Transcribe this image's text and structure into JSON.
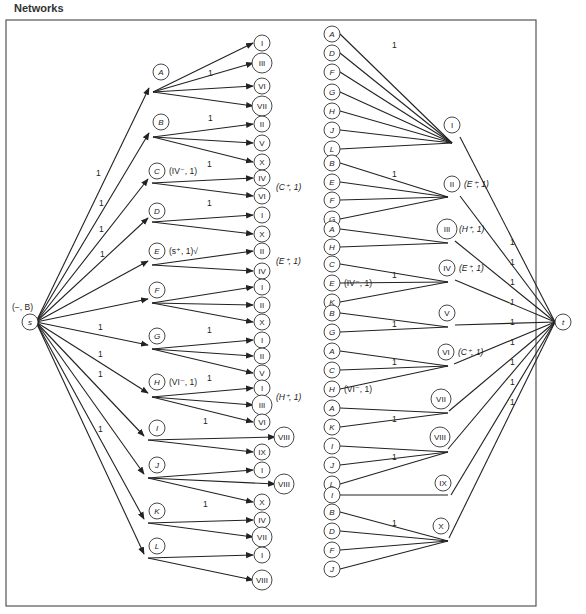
{
  "title": "Networks",
  "source": {
    "id": "s",
    "label": "s",
    "tag": "(−, B)",
    "x": 30,
    "y": 322
  },
  "sink": {
    "id": "t",
    "label": "t",
    "x": 563,
    "y": 322
  },
  "left_groups": [
    {
      "label": "A",
      "x": 161,
      "y": 72,
      "hub": [
        153,
        92
      ],
      "s_label": "1",
      "targets": [
        {
          "label": "I",
          "y": 43,
          "w": 1
        },
        {
          "label": "III",
          "y": 63
        },
        {
          "label": "VI",
          "y": 86
        },
        {
          "label": "VII",
          "y": 106
        }
      ],
      "edge_label": "1",
      "note": ""
    },
    {
      "label": "B",
      "x": 161,
      "y": 122,
      "hub": [
        153,
        137
      ],
      "targets": [
        {
          "label": "II",
          "y": 124
        },
        {
          "label": "V",
          "y": 143
        },
        {
          "label": "X",
          "y": 162
        }
      ],
      "edge_label": "1",
      "note": ""
    },
    {
      "label": "C",
      "x": 157,
      "y": 171,
      "hub": [
        152,
        183
      ],
      "targets": [
        {
          "label": "IV",
          "y": 178
        },
        {
          "label": "VI",
          "y": 196
        }
      ],
      "edge_label": "1",
      "note": "(IV⁻, 1)",
      "target_note": "(C⁺, 1)"
    },
    {
      "label": "D",
      "x": 157,
      "y": 211,
      "hub": [
        152,
        222
      ],
      "targets": [
        {
          "label": "I",
          "y": 215
        },
        {
          "label": "X",
          "y": 234
        }
      ],
      "edge_label": "1",
      "note": ""
    },
    {
      "label": "E",
      "x": 157,
      "y": 251,
      "hub": [
        152,
        265
      ],
      "targets": [
        {
          "label": "II",
          "y": 251
        },
        {
          "label": "IV",
          "y": 271
        }
      ],
      "edge_label": "",
      "note": "(s⁺, 1)√",
      "target_note": "(E⁺, 1)"
    },
    {
      "label": "F",
      "x": 157,
      "y": 290,
      "hub": [
        152,
        303
      ],
      "targets": [
        {
          "label": "I",
          "y": 287
        },
        {
          "label": "II",
          "y": 305
        },
        {
          "label": "X",
          "y": 322
        }
      ],
      "edge_label": "",
      "note": ""
    },
    {
      "label": "G",
      "x": 157,
      "y": 336,
      "hub": [
        152,
        349
      ],
      "targets": [
        {
          "label": "I",
          "y": 340
        },
        {
          "label": "II",
          "y": 356
        },
        {
          "label": "V",
          "y": 373
        }
      ],
      "edge_label": "1",
      "note": ""
    },
    {
      "label": "H",
      "x": 157,
      "y": 382,
      "hub": [
        152,
        397
      ],
      "targets": [
        {
          "label": "I",
          "y": 388
        },
        {
          "label": "III",
          "y": 405
        },
        {
          "label": "VI",
          "y": 422
        }
      ],
      "edge_label": "1",
      "note": "(VI⁻, 1)",
      "target_note": "(H⁺, 1)"
    },
    {
      "label": "I",
      "x": 157,
      "y": 428,
      "hub": [
        148,
        440
      ],
      "targets": [
        {
          "label": "VIII",
          "y": 437,
          "offset": 1
        },
        {
          "label": "IX",
          "y": 452
        }
      ],
      "edge_label": "1",
      "note": ""
    },
    {
      "label": "J",
      "x": 157,
      "y": 465,
      "hub": [
        148,
        478
      ],
      "targets": [
        {
          "label": "I",
          "y": 470
        },
        {
          "label": "VIII",
          "y": 484,
          "offset": 1
        },
        {
          "label": "X",
          "y": 502
        }
      ],
      "edge_label": "",
      "note": ""
    },
    {
      "label": "K",
      "x": 157,
      "y": 511,
      "hub": [
        148,
        523
      ],
      "targets": [
        {
          "label": "IV",
          "y": 520
        },
        {
          "label": "VII",
          "y": 537
        }
      ],
      "edge_label": "1",
      "note": ""
    },
    {
      "label": "L",
      "x": 157,
      "y": 546,
      "hub": [
        148,
        558
      ],
      "targets": [
        {
          "label": "I",
          "y": 555
        },
        {
          "label": "VIII",
          "y": 580
        }
      ],
      "edge_label": "",
      "note": ""
    }
  ],
  "s_edge_labels": [
    {
      "text": "1",
      "x": 96,
      "y": 176
    },
    {
      "text": "1",
      "x": 99,
      "y": 206
    },
    {
      "text": "1",
      "x": 99,
      "y": 232
    },
    {
      "text": "1",
      "x": 100,
      "y": 257
    },
    {
      "text": "1",
      "x": 98,
      "y": 330
    },
    {
      "text": "1",
      "x": 98,
      "y": 357
    },
    {
      "text": "1",
      "x": 98,
      "y": 377
    },
    {
      "text": "1",
      "x": 98,
      "y": 432
    }
  ],
  "right_groups": [
    {
      "label": "I",
      "x": 452,
      "y": 125,
      "hub": [
        452,
        143
      ],
      "sources": [
        "A",
        "D",
        "F",
        "G",
        "H",
        "J",
        "L"
      ],
      "source_ys": [
        34,
        53,
        72,
        92,
        111,
        130,
        149
      ],
      "edge_label": "1",
      "note": ""
    },
    {
      "label": "II",
      "x": 452,
      "y": 184,
      "hub": [
        448,
        197
      ],
      "sources": [
        "B",
        "E",
        "F",
        "G"
      ],
      "source_ys": [
        163,
        182,
        200,
        219
      ],
      "edge_label": "1",
      "note": "(E⁺; 1)"
    },
    {
      "label": "III",
      "x": 447,
      "y": 229,
      "hub": [
        448,
        243
      ],
      "sources": [
        "A",
        "H"
      ],
      "source_ys": [
        229,
        247
      ],
      "edge_label": "",
      "note": "(H⁺, 1)"
    },
    {
      "label": "IV",
      "x": 447,
      "y": 268,
      "hub": [
        448,
        282
      ],
      "sources": [
        "C",
        "E",
        "K"
      ],
      "source_ys": [
        264,
        283,
        302
      ],
      "edge_label": "1",
      "note": "(E⁺, 1)",
      "source_note": "(IV⁻, 1)"
    },
    {
      "label": "V",
      "x": 447,
      "y": 313,
      "hub": [
        448,
        327
      ],
      "sources": [
        "B",
        "G"
      ],
      "source_ys": [
        313,
        332
      ],
      "edge_label": "1",
      "note": ""
    },
    {
      "label": "VI",
      "x": 446,
      "y": 352,
      "hub": [
        448,
        366
      ],
      "sources": [
        "A",
        "C",
        "H"
      ],
      "source_ys": [
        351,
        370,
        389
      ],
      "edge_label": "1",
      "note": "(C⁺, 1)",
      "source_note": "(VI⁻, 1)"
    },
    {
      "label": "VII",
      "x": 441,
      "y": 399,
      "hub": [
        448,
        413
      ],
      "sources": [
        "A",
        "K"
      ],
      "source_ys": [
        408,
        427
      ],
      "edge_label": "1",
      "note": ""
    },
    {
      "label": "VIII",
      "x": 440,
      "y": 437,
      "hub": [
        448,
        452
      ],
      "sources": [
        "I",
        "J",
        "L"
      ],
      "source_ys": [
        446,
        465,
        484
      ],
      "edge_label": "1",
      "note": ""
    },
    {
      "label": "IX",
      "x": 443,
      "y": 483,
      "hub": [
        448,
        495
      ],
      "sources": [
        "I"
      ],
      "source_ys": [
        495
      ],
      "edge_label": "",
      "note": ""
    },
    {
      "label": "X",
      "x": 441,
      "y": 526,
      "hub": [
        448,
        541
      ],
      "sources": [
        "B",
        "D",
        "F",
        "J"
      ],
      "source_ys": [
        512,
        531,
        550,
        569
      ],
      "edge_label": "1",
      "note": ""
    }
  ],
  "t_edge_labels": [
    "1",
    "1",
    "1",
    "1",
    "1",
    "1",
    "1",
    "1",
    "1"
  ],
  "colors": {
    "ink": "#222222",
    "frame": "#555555",
    "background": "#ffffff"
  }
}
